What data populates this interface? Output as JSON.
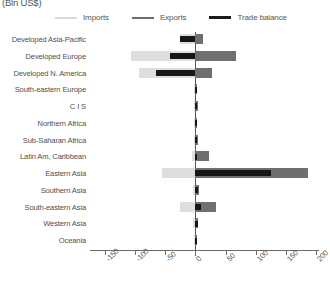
{
  "chart_data": {
    "type": "bar",
    "orientation": "horizontal",
    "title": "(Bln US$)",
    "xlabel": "",
    "ylabel": "",
    "xlim": [
      -175,
      205
    ],
    "xticks": [
      -150,
      -100,
      -50,
      0,
      50,
      100,
      150,
      200
    ],
    "xticklabels": [
      "-150",
      "-100",
      "-50",
      "0",
      "50",
      "100",
      "150",
      "200"
    ],
    "grid": false,
    "legend_position": "top",
    "categories": [
      "Developed Asia-Pacific",
      "Developed Europe",
      "Developed N. America",
      "South-eastern Europe",
      "C I S",
      "Northern Africa",
      "Sub-Saharan Africa",
      "Latin Am, Caribbean",
      "Eastern Asia",
      "Southern Asia",
      "South-eastern Asia",
      "Western Asia",
      "Oceania"
    ],
    "series": [
      {
        "name": "Imports",
        "color": "#dedede",
        "values": [
          -25,
          -107,
          -93,
          -2,
          -2,
          -2,
          -3,
          -5,
          -55,
          -4,
          -25,
          -4,
          -2
        ]
      },
      {
        "name": "Exports",
        "color": "#6f6f6f",
        "values": [
          12,
          68,
          28,
          3,
          4,
          3,
          4,
          22,
          187,
          6,
          34,
          5,
          3
        ]
      },
      {
        "name": "Trade balance",
        "color": "#161616",
        "values": [
          -25,
          -43,
          -66,
          2,
          3,
          2,
          3,
          3,
          125,
          5,
          10,
          4,
          2
        ]
      }
    ]
  },
  "legend": {
    "items": [
      {
        "label": "Imports",
        "swatch": "imports"
      },
      {
        "label": "Exports",
        "swatch": "exports"
      },
      {
        "label": "Trade balance",
        "swatch": "balance"
      }
    ]
  }
}
